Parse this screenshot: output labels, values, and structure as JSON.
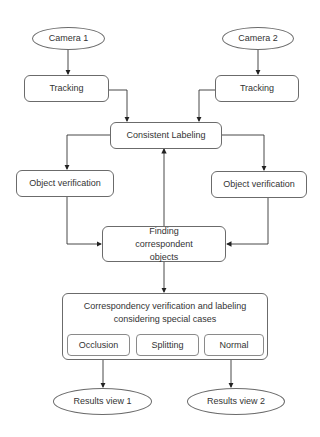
{
  "diagram": {
    "type": "flowchart",
    "nodes": {
      "camera1": {
        "label": "Camera 1",
        "shape": "ellipse"
      },
      "camera2": {
        "label": "Camera 2",
        "shape": "ellipse"
      },
      "tracking1": {
        "label": "Tracking",
        "shape": "rounded-rect"
      },
      "tracking2": {
        "label": "Tracking",
        "shape": "rounded-rect"
      },
      "consistent_labeling": {
        "label": "Consistent Labeling",
        "shape": "rounded-rect"
      },
      "object_verification1": {
        "label": "Object verification",
        "shape": "rounded-rect"
      },
      "object_verification2": {
        "label": "Object verification",
        "shape": "rounded-rect"
      },
      "finding": {
        "label": "Finding correspondent objects",
        "shape": "rounded-rect"
      },
      "correspondency": {
        "label": "Correspondency verification and labeling considering special cases",
        "shape": "rounded-rect",
        "cases": [
          "Occlusion",
          "Splitting",
          "Normal"
        ]
      },
      "results1": {
        "label": "Results view 1",
        "shape": "ellipse"
      },
      "results2": {
        "label": "Results view 2",
        "shape": "ellipse"
      }
    },
    "edges": [
      {
        "from": "Camera 1",
        "to": "Tracking (1)"
      },
      {
        "from": "Camera 2",
        "to": "Tracking (2)"
      },
      {
        "from": "Tracking (1)",
        "to": "Consistent Labeling"
      },
      {
        "from": "Tracking (2)",
        "to": "Consistent Labeling"
      },
      {
        "from": "Consistent Labeling",
        "to": "Object verification (1)"
      },
      {
        "from": "Consistent Labeling",
        "to": "Object verification (2)"
      },
      {
        "from": "Object verification (1)",
        "to": "Finding correspondent objects"
      },
      {
        "from": "Object verification (2)",
        "to": "Finding correspondent objects"
      },
      {
        "from": "Finding correspondent objects",
        "to": "Consistent Labeling"
      },
      {
        "from": "Finding correspondent objects",
        "to": "Correspondency verification and labeling considering special cases"
      },
      {
        "from": "Correspondency verification and labeling considering special cases",
        "to": "Results view 1"
      },
      {
        "from": "Correspondency verification and labeling considering special cases",
        "to": "Results view 2"
      }
    ],
    "colors": {
      "stroke": "#6b6b6b",
      "text": "#333333",
      "fill": "#ffffff"
    }
  }
}
